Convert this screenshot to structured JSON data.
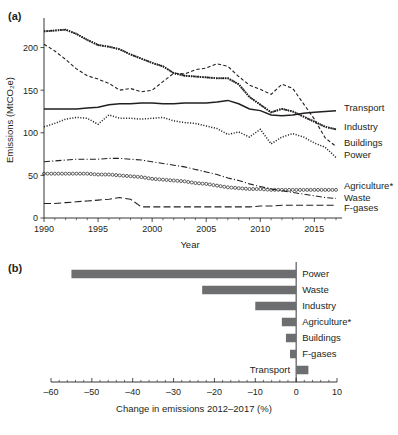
{
  "panels": {
    "a": {
      "tag": "(a)"
    },
    "b": {
      "tag": "(b)"
    }
  },
  "chart_data": [
    {
      "id": "panel-a",
      "type": "line",
      "title": "",
      "xlabel": "Year",
      "ylabel": "Emissions (MtCO₂e)",
      "xlim": [
        1990,
        2017
      ],
      "ylim": [
        0,
        230
      ],
      "yticks": [
        0,
        50,
        100,
        150,
        200
      ],
      "xticks": [
        1990,
        1995,
        2000,
        2005,
        2010,
        2015
      ],
      "xticklabels": [
        "1990",
        "1995",
        "2000",
        "2005",
        "2010",
        "2015"
      ],
      "yticklabels": [
        "0",
        "50",
        "100",
        "150",
        "200"
      ],
      "grid": false,
      "legend_position": "right-inline",
      "x": [
        1990,
        1991,
        1992,
        1993,
        1994,
        1995,
        1996,
        1997,
        1998,
        1999,
        2000,
        2001,
        2002,
        2003,
        2004,
        2005,
        2006,
        2007,
        2008,
        2009,
        2010,
        2011,
        2012,
        2013,
        2014,
        2015,
        2016,
        2017
      ],
      "series": [
        {
          "name": "Power",
          "style": "dotted-thick-dark",
          "label_anchor_value": 70,
          "values": [
            219,
            220,
            221,
            216,
            209,
            203,
            201,
            198,
            192,
            187,
            182,
            178,
            170,
            167,
            166,
            165,
            164,
            164,
            157,
            142,
            133,
            124,
            128,
            125,
            119,
            113,
            107,
            104
          ]
        },
        {
          "name": "Industry",
          "style": "dotted-medium",
          "label_anchor_value": 104,
          "values": [
            219,
            220,
            221,
            216,
            209,
            203,
            201,
            198,
            192,
            187,
            182,
            178,
            170,
            167,
            166,
            165,
            164,
            164,
            157,
            142,
            133,
            124,
            128,
            125,
            119,
            113,
            107,
            104
          ]
        },
        {
          "name": "Buildings",
          "style": "dashed-short",
          "label_anchor_value": 85,
          "values": [
            204,
            196,
            186,
            175,
            167,
            163,
            158,
            150,
            152,
            148,
            150,
            160,
            170,
            169,
            174,
            176,
            181,
            178,
            166,
            156,
            151,
            145,
            157,
            152,
            134,
            116,
            94,
            84
          ]
        },
        {
          "name": "Transport",
          "style": "solid",
          "label_anchor_value": 126,
          "values": [
            128,
            128,
            128,
            128,
            129,
            130,
            133,
            134,
            134,
            135,
            135,
            134,
            134,
            135,
            135,
            135,
            136,
            138,
            134,
            128,
            126,
            121,
            120,
            121,
            123,
            124,
            125,
            126
          ]
        },
        {
          "name": "Agriculture*",
          "style": "dotted-fine",
          "label_anchor_value": 37,
          "values": [
            107,
            111,
            116,
            118,
            117,
            110,
            121,
            117,
            117,
            116,
            117,
            118,
            114,
            112,
            111,
            108,
            105,
            98,
            101,
            95,
            104,
            87,
            95,
            99,
            95,
            88,
            83,
            71
          ]
        },
        {
          "name": "Waste",
          "style": "dash-dot",
          "label_anchor_value": 23,
          "values": [
            66,
            67,
            68,
            69,
            69,
            69,
            70,
            70,
            69,
            68,
            66,
            64,
            62,
            60,
            57,
            54,
            51,
            47,
            44,
            40,
            37,
            34,
            32,
            30,
            28,
            26,
            24,
            23
          ]
        },
        {
          "name": "F-gases",
          "style": "circles",
          "label_anchor_value": 33,
          "values": [
            52,
            52,
            52,
            52,
            52,
            51,
            51,
            50,
            49,
            48,
            46,
            45,
            44,
            43,
            41,
            40,
            38,
            36,
            35,
            34,
            34,
            33,
            33,
            33,
            33,
            33,
            33,
            33
          ]
        },
        {
          "name": "F-gases-lower",
          "style": "dashed-long",
          "label_anchor_value": 15,
          "values": [
            17,
            17,
            18,
            19,
            20,
            21,
            22,
            24,
            22,
            13,
            13,
            13,
            13,
            13,
            13,
            13,
            13,
            13,
            13,
            13,
            14,
            14,
            15,
            15,
            15,
            15,
            15,
            15
          ]
        }
      ],
      "legend_entries": [
        {
          "label": "Transport",
          "style": "solid"
        },
        {
          "label": "Industry",
          "style": "dotted-thick-dark"
        },
        {
          "label": "Buildings",
          "style": "dotted-fine"
        },
        {
          "label": "Power",
          "style": "dashed-short"
        },
        {
          "label": "Agriculture*",
          "style": "circles"
        },
        {
          "label": "Waste",
          "style": "dash-dot"
        },
        {
          "label": "F-gases",
          "style": "dashed-long"
        }
      ]
    },
    {
      "id": "panel-b",
      "type": "bar",
      "orientation": "horizontal",
      "title": "",
      "xlabel": "Change in emissions 2012–2017 (%)",
      "ylabel": "",
      "xlim": [
        -60,
        10
      ],
      "xticks": [
        -60,
        -50,
        -40,
        -30,
        -20,
        -10,
        0,
        10
      ],
      "xticklabels": [
        "–60",
        "–50",
        "–40",
        "–30",
        "–20",
        "–10",
        "0",
        "10"
      ],
      "grid": false,
      "bar_color": "#6d6e70",
      "categories": [
        "Power",
        "Waste",
        "Industry",
        "Agriculture*",
        "Buildings",
        "F-gases",
        "Transport"
      ],
      "values": [
        -55,
        -23,
        -10,
        -3.5,
        -2.5,
        -1.5,
        3
      ]
    }
  ]
}
